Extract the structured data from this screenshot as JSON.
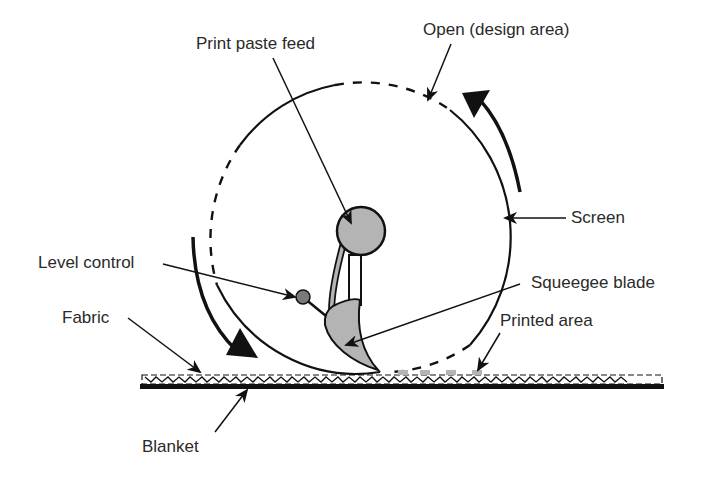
{
  "diagram": {
    "labels": {
      "print_paste_feed": "Print paste feed",
      "open_design_area": "Open (design area)",
      "screen": "Screen",
      "level_control": "Level control",
      "squeegee_blade": "Squeegee blade",
      "fabric": "Fabric",
      "printed_area": "Printed area",
      "blanket": "Blanket"
    },
    "colors": {
      "line": "#111111",
      "fill_gray": "#b4b4b4",
      "dark_gray": "#7a7a7a",
      "background": "#ffffff"
    }
  }
}
